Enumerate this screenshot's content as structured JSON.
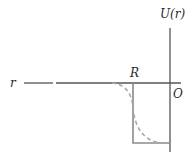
{
  "diagram": {
    "labels": {
      "y_axis": "U(r)",
      "x_axis": "r",
      "radius": "R",
      "origin": "O"
    },
    "colors": {
      "axis": "#555555",
      "square_well": "#8a8a8a",
      "smooth_potential": "#a8a8a8",
      "text": "#2a2a2a"
    },
    "elements": [
      {
        "id": "u-axis",
        "kind": "vertical-axis",
        "label": "U(r)"
      },
      {
        "id": "r-axis",
        "kind": "horizontal-axis",
        "direction": "left",
        "label": "r"
      },
      {
        "id": "square-well",
        "kind": "solid-line",
        "description": "Rectangular well of depth below zero, wall at r = R"
      },
      {
        "id": "smooth-potential",
        "kind": "dashed-curve",
        "description": "Smoothly rounded potential following the well"
      }
    ]
  }
}
